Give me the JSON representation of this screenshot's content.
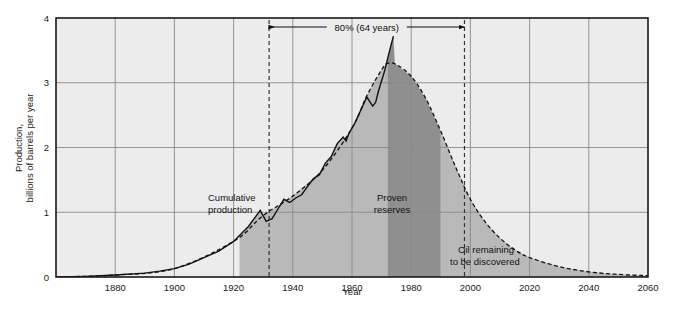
{
  "chart_data": {
    "type": "area",
    "title": "",
    "xlabel": "Year",
    "ylabel": "Production, billions of barrels per year",
    "ylabel_line1": "Production,",
    "ylabel_line2": "billions of barrels per year",
    "xlim": [
      1860,
      2060
    ],
    "ylim": [
      0,
      4
    ],
    "xticks": [
      1880,
      1900,
      1920,
      1940,
      1960,
      1980,
      2000,
      2020,
      2040,
      2060
    ],
    "xtick_labels": [
      "1880",
      "1900",
      "1920",
      "1940",
      "1960",
      "1980",
      "2000",
      "2020",
      "2040",
      "2060"
    ],
    "yticks": [
      0,
      1,
      2,
      3,
      4
    ],
    "ytick_labels": [
      "0",
      "1",
      "2",
      "3",
      "4"
    ],
    "grid": true,
    "legend": "none",
    "series": [
      {
        "name": "Actual production (historical)",
        "style": "solid-jagged",
        "points": [
          [
            1860,
            0.0
          ],
          [
            1870,
            0.01
          ],
          [
            1880,
            0.03
          ],
          [
            1890,
            0.06
          ],
          [
            1895,
            0.09
          ],
          [
            1900,
            0.13
          ],
          [
            1905,
            0.2
          ],
          [
            1910,
            0.3
          ],
          [
            1915,
            0.4
          ],
          [
            1920,
            0.55
          ],
          [
            1925,
            0.78
          ],
          [
            1929,
            1.03
          ],
          [
            1931,
            0.86
          ],
          [
            1933,
            0.9
          ],
          [
            1935,
            1.05
          ],
          [
            1937,
            1.2
          ],
          [
            1939,
            1.15
          ],
          [
            1941,
            1.22
          ],
          [
            1943,
            1.27
          ],
          [
            1945,
            1.4
          ],
          [
            1947,
            1.52
          ],
          [
            1949,
            1.58
          ],
          [
            1951,
            1.76
          ],
          [
            1953,
            1.86
          ],
          [
            1955,
            2.06
          ],
          [
            1957,
            2.16
          ],
          [
            1958,
            2.1
          ],
          [
            1959,
            2.22
          ],
          [
            1961,
            2.38
          ],
          [
            1963,
            2.58
          ],
          [
            1965,
            2.78
          ],
          [
            1967,
            2.64
          ],
          [
            1968,
            2.7
          ],
          [
            1969,
            2.88
          ],
          [
            1971,
            3.18
          ],
          [
            1973,
            3.55
          ],
          [
            1974,
            3.72
          ]
        ]
      },
      {
        "name": "Hubbert bell curve (projected)",
        "style": "dashed-smooth",
        "peak_year": 1972,
        "peak_value": 3.3,
        "points": [
          [
            1860,
            0.0
          ],
          [
            1880,
            0.03
          ],
          [
            1900,
            0.13
          ],
          [
            1920,
            0.55
          ],
          [
            1930,
            0.95
          ],
          [
            1940,
            1.25
          ],
          [
            1950,
            1.65
          ],
          [
            1960,
            2.3
          ],
          [
            1965,
            2.8
          ],
          [
            1970,
            3.2
          ],
          [
            1972,
            3.3
          ],
          [
            1975,
            3.28
          ],
          [
            1980,
            3.1
          ],
          [
            1985,
            2.75
          ],
          [
            1990,
            2.25
          ],
          [
            1995,
            1.7
          ],
          [
            2000,
            1.2
          ],
          [
            2005,
            0.85
          ],
          [
            2010,
            0.6
          ],
          [
            2015,
            0.42
          ],
          [
            2020,
            0.3
          ],
          [
            2030,
            0.16
          ],
          [
            2040,
            0.08
          ],
          [
            2050,
            0.04
          ],
          [
            2060,
            0.02
          ]
        ]
      }
    ],
    "regions": [
      {
        "name": "cumulative-production",
        "label_line1": "Cumulative",
        "label_line2": "production",
        "x_start": 1922,
        "x_end": 1972,
        "shade": "#b9b9b9"
      },
      {
        "name": "proven-reserves",
        "label_line1": "Proven",
        "label_line2": "reserves",
        "x_start": 1972,
        "x_end": 1990,
        "shade": "#8f8f8f"
      },
      {
        "name": "oil-remaining-to-be-discovered",
        "label_line1": "Oil remaining",
        "label_line2": "to be discovered",
        "x_start": 1990,
        "x_end": 2060,
        "shade": "#b9b9b9"
      }
    ],
    "markers": [
      {
        "name": "left-dashed-marker",
        "year": 1932,
        "style": "dashed-vertical"
      },
      {
        "name": "right-dashed-marker",
        "year": 1998,
        "style": "dashed-vertical"
      }
    ],
    "annotations": [
      {
        "name": "span-annotation",
        "text": "80% (64 years)",
        "from_year": 1932,
        "to_year": 1998,
        "at_value": 3.86
      }
    ]
  },
  "colors": {
    "plot_background": "#ececec",
    "grid_line": "#8a8a8a",
    "frame": "#1a1a1a",
    "curve": "#111111",
    "shade_light": "#b9b9b9",
    "shade_dark": "#8f8f8f",
    "page_background": "#ffffff"
  }
}
